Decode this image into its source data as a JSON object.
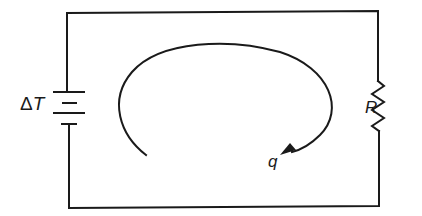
{
  "diagram": {
    "type": "thermal circuit analogy",
    "labels": {
      "source_delta": "Δ",
      "source_symbol": "T",
      "resistor": "R",
      "flow": "q"
    },
    "elements": [
      {
        "id": "source",
        "kind": "battery",
        "label": "ΔT",
        "position": "left"
      },
      {
        "id": "resistor",
        "kind": "resistor",
        "label": "R",
        "position": "right"
      },
      {
        "id": "flow-arrow",
        "kind": "curved-arrow",
        "label": "q",
        "direction": "clockwise"
      }
    ],
    "colors": {
      "line": "#1a1a1a",
      "background": "#ffffff"
    }
  }
}
